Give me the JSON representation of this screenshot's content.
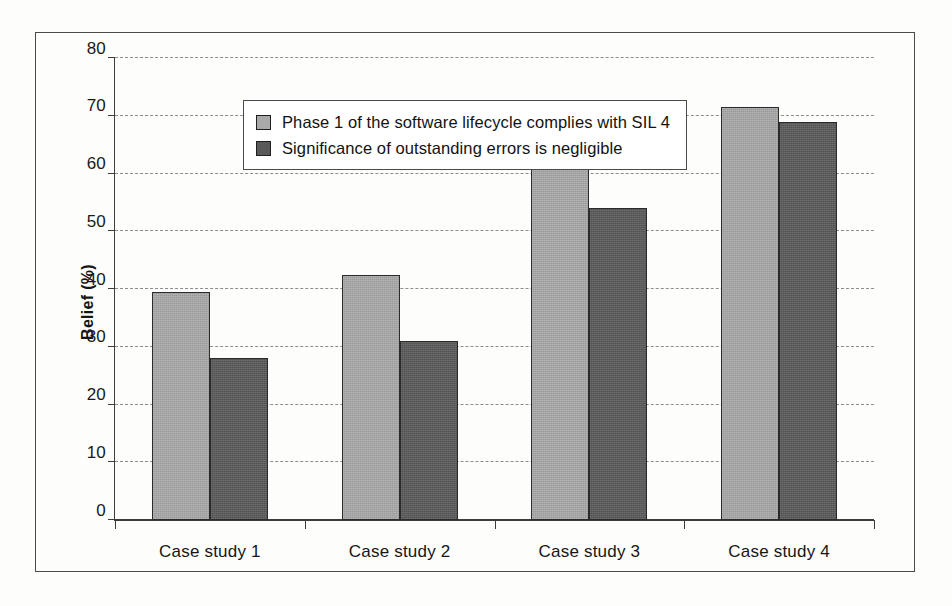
{
  "chart_data": {
    "type": "bar",
    "title": "",
    "xlabel": "",
    "ylabel": "Belief (%)",
    "categories": [
      "Case study 1",
      "Case study 2",
      "Case study 3",
      "Case study 4"
    ],
    "series": [
      {
        "name": "Phase 1 of the software lifecycle complies with SIL 4",
        "color": "#a9a9a9",
        "values": [
          39.5,
          42.5,
          61,
          71.5
        ]
      },
      {
        "name": "Significance of outstanding errors is negligible",
        "color": "#595959",
        "values": [
          28,
          31,
          54,
          69
        ]
      }
    ],
    "ylim": [
      0,
      80
    ],
    "yticks": [
      0,
      10,
      20,
      30,
      40,
      50,
      60,
      70,
      80
    ],
    "ytick_labels": [
      "0",
      "10",
      "20",
      "30",
      "40",
      "50",
      "60",
      "70",
      "80"
    ],
    "grid": true,
    "grid_style": "dashed",
    "grid_color": "#8d8d8d",
    "legend_position": "upper left",
    "frame": true
  },
  "legend": {
    "entries": [
      {
        "label": "Phase 1 of the software lifecycle complies with SIL 4",
        "swatch": "light-gray-swatch"
      },
      {
        "label": "Significance of outstanding errors is negligible",
        "swatch": "dark-gray-swatch"
      }
    ]
  }
}
